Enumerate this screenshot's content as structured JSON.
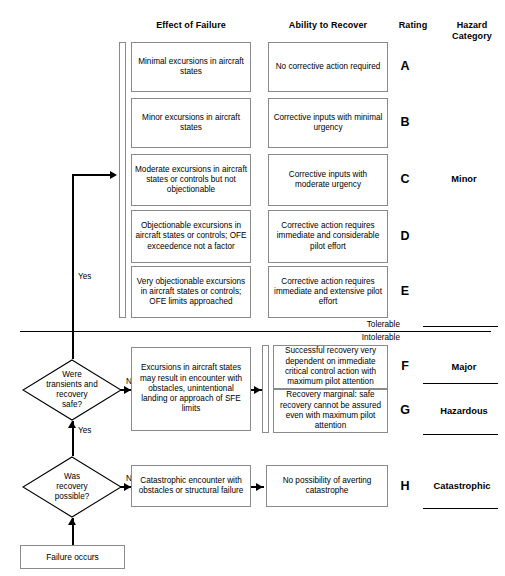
{
  "headers": {
    "effect_of_failure": "Effect of Failure",
    "ability_to_recover": "Ability to Recover",
    "rating": "Rating",
    "hazard_category_line1": "Hazard",
    "hazard_category_line2": "Category"
  },
  "effect_boxes": [
    "Minimal excursions in aircraft states",
    "Minor excursions in aircraft states",
    "Moderate excursions in aircraft states or controls but not objectionable",
    "Objectionable excursions in aircraft states or controls; OFE exceedence not a factor",
    "Very objectionable excursions in aircraft states or controls; OFE limits approached"
  ],
  "recover_boxes": [
    "No corrective action required",
    "Corrective inputs with minimal urgency",
    "Corrective inputs with moderate urgency",
    "Corrective action requires immediate and considerable pilot effort",
    "Corrective action requires immediate and extensive pilot effort"
  ],
  "ratings": [
    "A",
    "B",
    "C",
    "D",
    "E",
    "F",
    "G",
    "H"
  ],
  "hazard_categories": [
    {
      "rating": "C",
      "label": "Minor"
    },
    {
      "rating": "F",
      "label": "Major"
    },
    {
      "rating": "G",
      "label": "Hazardous"
    },
    {
      "rating": "H",
      "label": "Catastrophic"
    }
  ],
  "tolerance": {
    "tolerable": "Tolerable",
    "intolerable": "Intolerable"
  },
  "lower_section": {
    "decision_1": {
      "line1": "Were",
      "line2": "transients and",
      "line3": "recovery",
      "line4": "safe?",
      "no_label": "No",
      "yes_label": "Yes"
    },
    "decision_2": {
      "line1": "Was",
      "line2": "recovery",
      "line3": "possible?",
      "no_label": "No"
    },
    "effect_box_major": "Excursions in aircraft states may result in encounter with obstacles, unintentional landing or approach of SFE limits",
    "effect_box_catastrophic": "Catastrophic encounter with obstacles or structural failure",
    "recover_box_f": "Successful recovery very dependent on immediate critical control action with maximum pilot attention",
    "recover_box_g": "Recovery marginal: safe recovery cannot be assured even with maximum pilot attention",
    "recover_box_h": "No possibility of averting catastrophe",
    "start_box": "Failure occurs"
  },
  "top_yes_label": "Yes",
  "colors": {
    "box_border": "#8a8a8a",
    "line": "#000000",
    "background": "#ffffff",
    "text": "#000000"
  }
}
